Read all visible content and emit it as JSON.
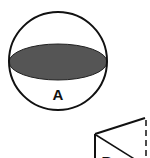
{
  "figures": [
    {
      "id": "A",
      "label": "A",
      "shape": "sphere",
      "cross_section": "horizontal plane through center (great circle), shaded",
      "colors": {
        "outline": "#111111",
        "section_fill": "#555555"
      }
    },
    {
      "id": "B",
      "label": "B",
      "shape": "cube (partially visible)",
      "cross_section": "diagonal plane",
      "colors": {
        "outline": "#111111",
        "hidden_edge": "#111111"
      }
    }
  ]
}
